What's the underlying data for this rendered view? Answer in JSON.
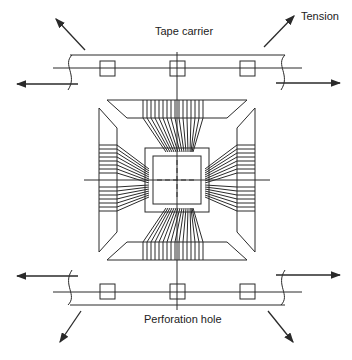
{
  "labels": {
    "tension": "Tension",
    "tape_carrier": "Tape carrier",
    "perforation_hole": "Perforation hole"
  },
  "colors": {
    "line": "#2a2a2a",
    "background": "#ffffff"
  },
  "diagram": {
    "type": "tape-carrier-package-schematic",
    "perforation_holes_per_strip": 3,
    "strips": [
      "top",
      "bottom"
    ],
    "lead_groups": [
      "top",
      "bottom",
      "left",
      "right"
    ],
    "tension_arrows": 8
  }
}
